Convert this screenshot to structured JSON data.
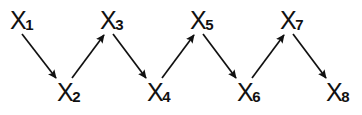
{
  "diagram": {
    "type": "directed-chain-graph",
    "title": "",
    "background_color": "#ffffff",
    "stroke_color": "#111111",
    "canvas": {
      "width": 362,
      "height": 115
    },
    "nodes": [
      {
        "id": "x1",
        "var": "X",
        "subscript": "1",
        "label": "X1",
        "x": 10,
        "y": 8,
        "row": "top"
      },
      {
        "id": "x2",
        "var": "X",
        "subscript": "2",
        "label": "X2",
        "x": 57,
        "y": 80,
        "row": "bottom"
      },
      {
        "id": "x3",
        "var": "X",
        "subscript": "3",
        "label": "X3",
        "x": 100,
        "y": 8,
        "row": "top"
      },
      {
        "id": "x4",
        "var": "X",
        "subscript": "4",
        "label": "X4",
        "x": 147,
        "y": 80,
        "row": "bottom"
      },
      {
        "id": "x5",
        "var": "X",
        "subscript": "5",
        "label": "X5",
        "x": 190,
        "y": 8,
        "row": "top"
      },
      {
        "id": "x6",
        "var": "X",
        "subscript": "6",
        "label": "X6",
        "x": 237,
        "y": 80,
        "row": "bottom"
      },
      {
        "id": "x7",
        "var": "X",
        "subscript": "7",
        "label": "X7",
        "x": 280,
        "y": 8,
        "row": "top"
      },
      {
        "id": "x8",
        "var": "X",
        "subscript": "8",
        "label": "X8",
        "x": 326,
        "y": 80,
        "row": "bottom"
      }
    ],
    "edges": [
      {
        "id": "e1",
        "from": "x1",
        "to": "x2",
        "direction": "down-right",
        "x1": 22,
        "y1": 34,
        "x2": 56,
        "y2": 78
      },
      {
        "id": "e2",
        "from": "x2",
        "to": "x3",
        "direction": "up-right",
        "x1": 72,
        "y1": 78,
        "x2": 104,
        "y2": 35
      },
      {
        "id": "e3",
        "from": "x3",
        "to": "x4",
        "direction": "down-right",
        "x1": 113,
        "y1": 34,
        "x2": 146,
        "y2": 78
      },
      {
        "id": "e4",
        "from": "x4",
        "to": "x5",
        "direction": "up-right",
        "x1": 162,
        "y1": 78,
        "x2": 194,
        "y2": 35
      },
      {
        "id": "e5",
        "from": "x5",
        "to": "x6",
        "direction": "down-right",
        "x1": 203,
        "y1": 34,
        "x2": 236,
        "y2": 78
      },
      {
        "id": "e6",
        "from": "x6",
        "to": "x7",
        "direction": "up-right",
        "x1": 252,
        "y1": 78,
        "x2": 284,
        "y2": 35
      },
      {
        "id": "e7",
        "from": "x7",
        "to": "x8",
        "direction": "down-right",
        "x1": 293,
        "y1": 34,
        "x2": 326,
        "y2": 78
      }
    ]
  }
}
